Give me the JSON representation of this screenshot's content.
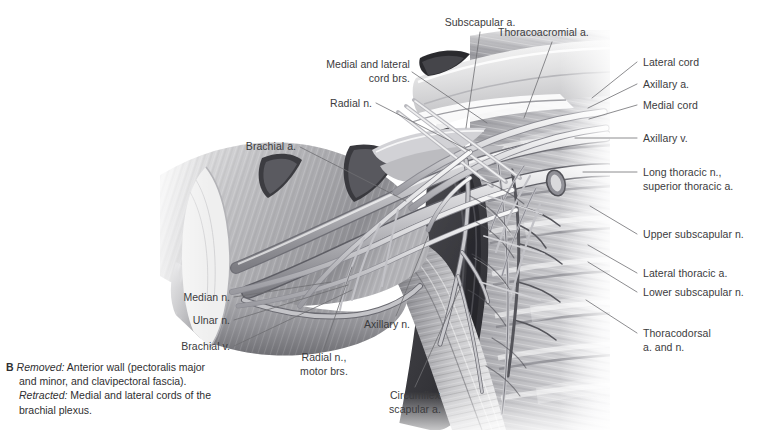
{
  "figure": {
    "panel_letter": "B",
    "caption_segments": [
      {
        "style": "italic",
        "text": "Removed:"
      },
      {
        "style": "normal",
        "text": " Anterior wall (pectoralis major and minor, and clavipectoral fascia)."
      },
      {
        "style": "italic",
        "text": "Retracted:"
      },
      {
        "style": "normal",
        "text": " Medial and lateral cords of the brachial plexus."
      }
    ],
    "caption_line1_italic": "Removed:",
    "caption_line1_text": " Anterior wall (pectoralis major",
    "caption_line2_text": "and minor, and clavipectoral fascia).",
    "caption_line3_italic": "Retracted:",
    "caption_line3_text": " Medial and lateral cords of the",
    "caption_line4_text": "brachial plexus."
  },
  "style": {
    "label_color": "#3b3b3d",
    "leader_color": "#6e6e72",
    "background": "#ffffff",
    "ink_dark": "#2b2b2d",
    "ink_mid": "#8d8d92",
    "ink_light": "#d8d8da"
  },
  "labels": [
    {
      "id": "subscapular-a",
      "text": "Subscapular a.",
      "align": "center",
      "x": 480,
      "y": 16,
      "leader": [
        [
          480,
          32
        ],
        [
          466,
          128
        ]
      ]
    },
    {
      "id": "thoracoacromial-a",
      "text": "Thoracoacromial a.",
      "align": "left-start",
      "x": 498,
      "y": 26,
      "leader": [
        [
          552,
          42
        ],
        [
          524,
          118
        ]
      ]
    },
    {
      "id": "medial-and-lateral-cord-brs",
      "text": "Medial and lateral\ncord brs.",
      "align": "left",
      "x": 410,
      "y": 58,
      "leader": [
        [
          412,
          72
        ],
        [
          487,
          123
        ]
      ]
    },
    {
      "id": "radial-n",
      "text": "Radial n.",
      "align": "left",
      "x": 372,
      "y": 97,
      "leader": [
        [
          376,
          103
        ],
        [
          470,
          151
        ]
      ]
    },
    {
      "id": "brachial-a",
      "text": "Brachial a.",
      "align": "left",
      "x": 296,
      "y": 140,
      "leader": [
        [
          300,
          147
        ],
        [
          406,
          201
        ]
      ]
    },
    {
      "id": "lateral-cord",
      "text": "Lateral cord",
      "align": "right",
      "x": 643,
      "y": 56,
      "leader": [
        [
          637,
          62
        ],
        [
          592,
          98
        ]
      ]
    },
    {
      "id": "axillary-a",
      "text": "Axillary a.",
      "align": "right",
      "x": 643,
      "y": 78,
      "leader": [
        [
          637,
          84
        ],
        [
          588,
          108
        ]
      ]
    },
    {
      "id": "medial-cord",
      "text": "Medial cord",
      "align": "right",
      "x": 643,
      "y": 99,
      "leader": [
        [
          637,
          105
        ],
        [
          589,
          119
        ]
      ]
    },
    {
      "id": "axillary-v",
      "text": "Axillary v.",
      "align": "right",
      "x": 643,
      "y": 132,
      "leader": [
        [
          637,
          138
        ],
        [
          575,
          138
        ]
      ]
    },
    {
      "id": "long-thoracic-n-superior-thoracic-a",
      "text": "Long thoracic n.,\nsuperior thoracic a.",
      "align": "right",
      "x": 643,
      "y": 166,
      "leader": [
        [
          637,
          172
        ],
        [
          583,
          172
        ]
      ]
    },
    {
      "id": "upper-subscapular-n",
      "text": "Upper subscapular n.",
      "align": "right",
      "x": 643,
      "y": 228,
      "leader": [
        [
          637,
          234
        ],
        [
          590,
          206
        ]
      ]
    },
    {
      "id": "lateral-thoracic-a",
      "text": "Lateral thoracic a.",
      "align": "right",
      "x": 643,
      "y": 267,
      "leader": [
        [
          637,
          273
        ],
        [
          588,
          245
        ]
      ]
    },
    {
      "id": "lower-subscapular-n",
      "text": "Lower subscapular n.",
      "align": "right",
      "x": 643,
      "y": 286,
      "leader": [
        [
          637,
          292
        ],
        [
          588,
          262
        ]
      ]
    },
    {
      "id": "thoracodorsal-a-and-n",
      "text": "Thoracodorsal\na. and n.",
      "align": "right",
      "x": 643,
      "y": 327,
      "leader": [
        [
          637,
          333
        ],
        [
          586,
          300
        ]
      ]
    },
    {
      "id": "median-n",
      "text": "Median n.",
      "align": "left",
      "x": 230,
      "y": 291,
      "leader": [
        [
          234,
          297
        ],
        [
          331,
          282
        ]
      ]
    },
    {
      "id": "ulnar-n",
      "text": "Ulnar n.",
      "align": "left",
      "x": 230,
      "y": 314,
      "leader": [
        [
          234,
          320
        ],
        [
          348,
          285
        ]
      ]
    },
    {
      "id": "brachial-v",
      "text": "Brachial v.",
      "align": "left",
      "x": 230,
      "y": 340,
      "leader": [
        [
          234,
          346
        ],
        [
          352,
          290
        ]
      ]
    },
    {
      "id": "radial-n-motor-brs",
      "text": "Radial n.,\nmotor brs.",
      "align": "center",
      "x": 324,
      "y": 351,
      "leader": [
        [
          324,
          349
        ],
        [
          352,
          267
        ]
      ]
    },
    {
      "id": "axillary-n",
      "text": "Axillary n.",
      "align": "left",
      "x": 410,
      "y": 318,
      "leader": [
        [
          396,
          316
        ],
        [
          428,
          236
        ]
      ]
    },
    {
      "id": "circumflex-scapular-a",
      "text": "Circumflex\nscapular a.",
      "align": "center",
      "x": 415,
      "y": 389,
      "leader": [
        [
          415,
          387
        ],
        [
          462,
          284
        ]
      ]
    }
  ]
}
